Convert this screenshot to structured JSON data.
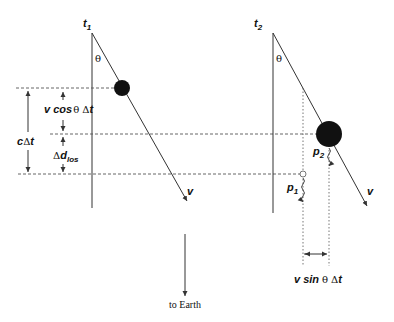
{
  "diagram": {
    "frames": [
      {
        "time_label": "t",
        "time_sub": "1",
        "angle_label": "θ",
        "velocity_label": "v"
      },
      {
        "time_label": "t",
        "time_sub": "2",
        "angle_label": "θ",
        "velocity_label": "v"
      }
    ],
    "points": [
      {
        "label": "p",
        "sub": "1"
      },
      {
        "label": "p",
        "sub": "2"
      }
    ],
    "measurements": {
      "c_dt": {
        "main": "c",
        "delta": "Δ",
        "var": "t"
      },
      "v_cos": {
        "v": "v cos",
        "theta": "θ",
        "delta": "Δ",
        "t": "t"
      },
      "d_los": {
        "delta": "Δ",
        "main": "d",
        "sub": "los"
      },
      "v_sin": {
        "v": "v sin",
        "theta": "θ",
        "delta": "Δ",
        "t": "t"
      }
    },
    "earth_label": "to Earth"
  },
  "colors": {
    "ink": "#111111",
    "line": "#333333",
    "dash": "#555555",
    "background": "#ffffff"
  }
}
